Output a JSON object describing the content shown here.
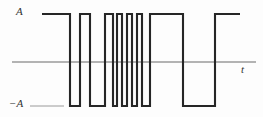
{
  "figure": {
    "labels": {
      "amplitude_positive": "A",
      "amplitude_negative": "−A",
      "time_axis": "t"
    },
    "colors": {
      "signal": "#262626",
      "axis": "#6b6b6b",
      "guide": "#8a8a8a",
      "background": "#fdfdfd"
    }
  },
  "chart_data": {
    "type": "line",
    "title": "",
    "xlabel": "t",
    "ylabel": "A",
    "subtitle": "",
    "grid": false,
    "legend_position": "none",
    "xlim": [
      0,
      263
    ],
    "ylim": [
      -1,
      1
    ],
    "y_levels": {
      "positive": 1,
      "zero": 0,
      "negative": -1
    },
    "y_tick_labels": [
      "A",
      "−A"
    ],
    "axis_pixel_y": {
      "top_level": 14,
      "zero_line": 62,
      "bottom_level": 106
    },
    "axis_pixel_x": {
      "axis_start": 12,
      "axis_end": 256,
      "signal_start": 42,
      "signal_end": 240
    },
    "transitions_px": [
      42,
      70,
      80,
      90,
      105,
      113,
      117,
      122,
      127,
      132,
      137,
      142,
      150,
      183,
      215
    ],
    "levels_sequence": [
      1,
      -1,
      1,
      -1,
      1,
      -1,
      1,
      -1,
      1,
      -1,
      1,
      -1,
      1,
      -1,
      1
    ],
    "segments": [
      {
        "x_start": 42,
        "x_end": 70,
        "level": 1
      },
      {
        "x_start": 70,
        "x_end": 80,
        "level": -1
      },
      {
        "x_start": 80,
        "x_end": 90,
        "level": 1
      },
      {
        "x_start": 90,
        "x_end": 105,
        "level": -1
      },
      {
        "x_start": 105,
        "x_end": 113,
        "level": 1
      },
      {
        "x_start": 113,
        "x_end": 117,
        "level": -1
      },
      {
        "x_start": 117,
        "x_end": 122,
        "level": 1
      },
      {
        "x_start": 122,
        "x_end": 127,
        "level": -1
      },
      {
        "x_start": 127,
        "x_end": 132,
        "level": 1
      },
      {
        "x_start": 132,
        "x_end": 137,
        "level": -1
      },
      {
        "x_start": 137,
        "x_end": 142,
        "level": 1
      },
      {
        "x_start": 142,
        "x_end": 150,
        "level": -1
      },
      {
        "x_start": 150,
        "x_end": 183,
        "level": 1
      },
      {
        "x_start": 183,
        "x_end": 215,
        "level": -1
      },
      {
        "x_start": 215,
        "x_end": 240,
        "level": 1
      }
    ],
    "guide_lines": [
      {
        "name": "negative-amplitude-guide",
        "x_start": 30,
        "x_end": 64,
        "y": 106
      }
    ]
  }
}
